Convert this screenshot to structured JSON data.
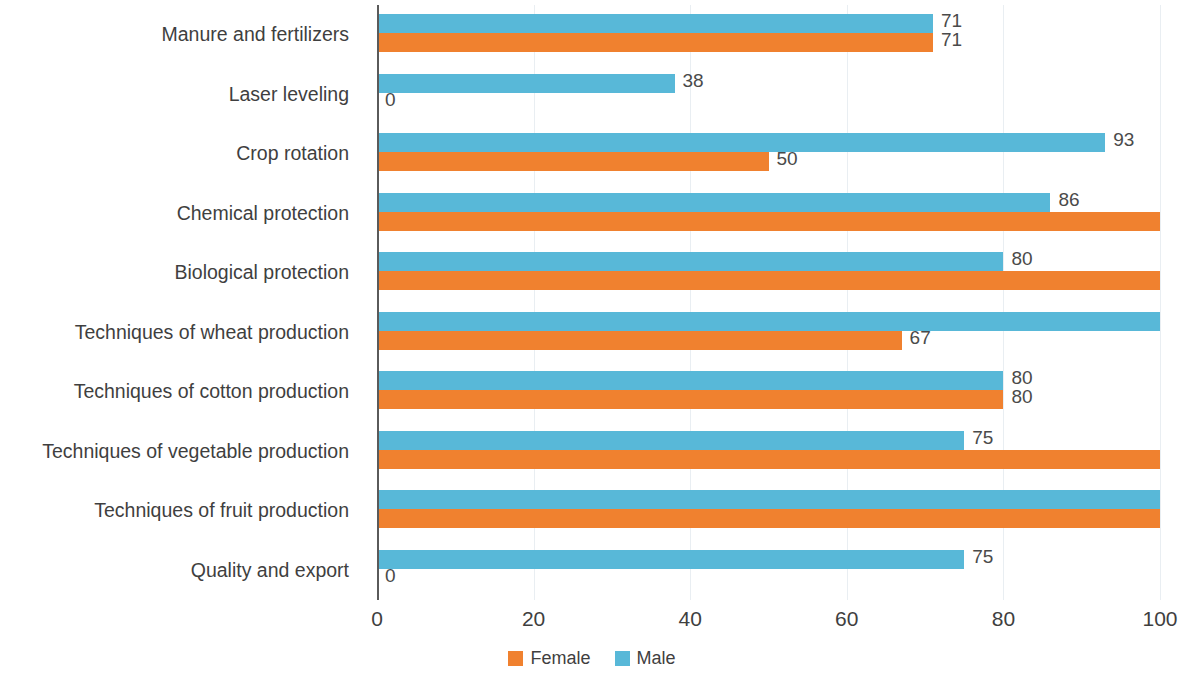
{
  "chart_data": {
    "type": "bar",
    "orientation": "horizontal",
    "title": "",
    "xlabel": "",
    "ylabel": "",
    "xlim": [
      0,
      100
    ],
    "xticks": [
      "0",
      "20",
      "40",
      "60",
      "80",
      "100"
    ],
    "grid": true,
    "legend_position": "bottom",
    "categories": [
      "Manure and fertilizers",
      "Laser leveling",
      "Crop rotation",
      "Chemical protection",
      "Biological protection",
      "Techniques of wheat production",
      "Techniques of cotton production",
      "Techniques of vegetable production",
      "Techniques of fruit production",
      "Quality and export"
    ],
    "series": [
      {
        "name": "Male",
        "color": "#58b8d8",
        "values": [
          71,
          38,
          93,
          86,
          80,
          100,
          80,
          75,
          100,
          75
        ],
        "labels": [
          "71",
          "38",
          "93",
          "86",
          "80",
          "",
          "80",
          "75",
          "",
          "75"
        ]
      },
      {
        "name": "Female",
        "color": "#f0812f",
        "values": [
          71,
          0,
          50,
          100,
          100,
          67,
          80,
          100,
          100,
          0
        ],
        "labels": [
          "71",
          "0",
          "50",
          "",
          "",
          "67",
          "80",
          "",
          "",
          "0"
        ]
      }
    ]
  },
  "legend": {
    "items": [
      {
        "label": "Female",
        "color": "#f0812f"
      },
      {
        "label": "Male",
        "color": "#58b8d8"
      }
    ]
  }
}
